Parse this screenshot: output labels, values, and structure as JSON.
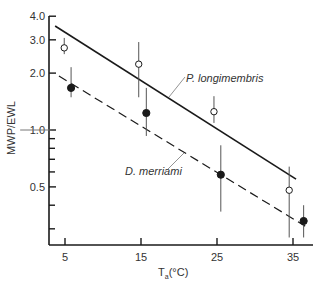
{
  "chart_data": {
    "type": "scatter",
    "title": "",
    "xlabel": "T_a (°C)",
    "xlabel_main": "T",
    "xlabel_sub": "a",
    "xlabel_unit": "(°C)",
    "ylabel": "MWP/EWL",
    "yscale": "log",
    "xlim": [
      -3,
      38
    ],
    "ylim": [
      0.26,
      4.0
    ],
    "grid": false,
    "legend": "inline labels with leader lines",
    "x_ticks": [
      {
        "value": 5,
        "label": "5"
      },
      {
        "value": 15,
        "label": "15"
      },
      {
        "value": 25,
        "label": "25"
      },
      {
        "value": 35,
        "label": "35"
      }
    ],
    "y_ticks_major": [
      {
        "value": 4.0,
        "label": "4.0"
      },
      {
        "value": 3.0,
        "label": "3.0"
      },
      {
        "value": 2.0,
        "label": "2.0"
      },
      {
        "value": 1.0,
        "label": "1.0"
      },
      {
        "value": 0.5,
        "label": "0.5"
      }
    ],
    "y_ticks_minor": [
      0.9,
      0.8,
      0.7,
      0.6,
      0.4,
      0.3
    ],
    "reference_line": {
      "y": 1.0,
      "x_from": -0.9,
      "x_to": 3.2
    },
    "series": [
      {
        "name": "P. longimembris",
        "marker": "open-circle",
        "line_style": "solid",
        "points": [
          {
            "x": 4.9,
            "y": 2.72,
            "err_low": 2.52,
            "err_high": 3.07
          },
          {
            "x": 14.7,
            "y": 2.23,
            "err_low": 1.49,
            "err_high": 2.92
          },
          {
            "x": 24.6,
            "y": 1.25,
            "err_low": 1.09,
            "err_high": 1.51
          },
          {
            "x": 34.5,
            "y": 0.48,
            "err_low": 0.27,
            "err_high": 0.64
          }
        ],
        "fit_line": {
          "x1": 3.7,
          "y1": 3.55,
          "x2": 35.4,
          "y2": 0.55
        },
        "label_anchor": {
          "x": 19.4,
          "y": 1.8
        }
      },
      {
        "name": "D. merriami",
        "marker": "filled-circle",
        "line_style": "dashed",
        "points": [
          {
            "x": 5.8,
            "y": 1.67,
            "err_low": 1.49,
            "err_high": 2.15
          },
          {
            "x": 15.7,
            "y": 1.23,
            "err_low": 0.93,
            "err_high": 1.67
          },
          {
            "x": 25.5,
            "y": 0.58,
            "err_low": 0.37,
            "err_high": 0.83
          },
          {
            "x": 36.4,
            "y": 0.33,
            "err_low": 0.27,
            "err_high": 0.4
          }
        ],
        "fit_line": {
          "x1": 4.2,
          "y1": 1.93,
          "x2": 36.6,
          "y2": 0.31
        },
        "label_anchor": {
          "x": 20.6,
          "y": 0.91
        }
      }
    ]
  },
  "labels": {
    "series_1": "P. longimembris",
    "series_2": "D. merriami",
    "ylabel": "MWP/EWL",
    "xlabel_main": "T",
    "xlabel_sub": "a",
    "xlabel_unit": "(°C)"
  },
  "colors": {
    "ink": "#1a1a1a",
    "text": "#333333",
    "errorbar": "#555555",
    "background": "#ffffff"
  }
}
